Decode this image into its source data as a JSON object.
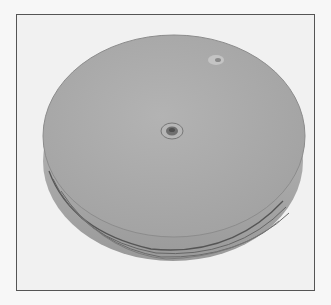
{
  "image": {
    "subject": "buffing wheel disc",
    "colors": {
      "background": "#f1f1f1",
      "frame_border": "#555555",
      "disc_face": "#a9a9a9",
      "disc_edge": "#8c8c8c",
      "hub": "#8a8a8a"
    }
  }
}
